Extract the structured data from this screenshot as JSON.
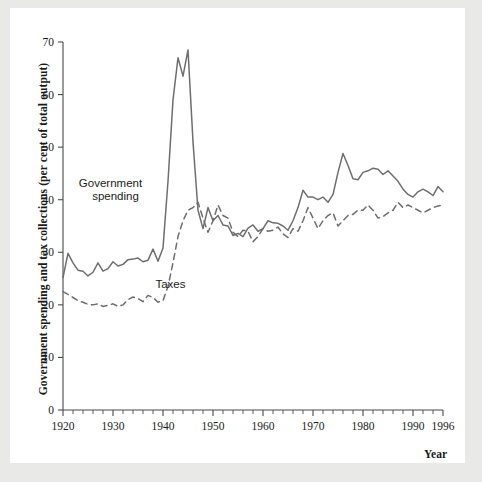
{
  "chart_data": {
    "type": "line",
    "title": "",
    "xlabel": "Year",
    "ylabel": "Government spending and tax collections (per cent of total output)",
    "xlim": [
      1920,
      1996
    ],
    "ylim": [
      0,
      70
    ],
    "grid": false,
    "legend_position": "inline-annotations",
    "y_ticks": [
      0,
      10,
      20,
      30,
      40,
      50,
      60,
      70
    ],
    "y_tick_labels": [
      "0",
      "10",
      "20",
      "30",
      "40",
      "50",
      "60",
      "70"
    ],
    "x_ticks": [
      1920,
      1930,
      1940,
      1950,
      1960,
      1970,
      1980,
      1990,
      1996
    ],
    "x_tick_labels": [
      "1920",
      "1930",
      "1940",
      "1950",
      "1960",
      "1970",
      "1980",
      "1990",
      "1996"
    ],
    "x_minor_tick_step": 2,
    "line_color": "#6e6e6e",
    "annotations": [
      {
        "text": "Government",
        "x": 1929.5,
        "y": 42.5
      },
      {
        "text": "spending",
        "x": 1930.5,
        "y": 40.0
      },
      {
        "text": "Taxes",
        "x": 1941.5,
        "y": 23.3
      }
    ],
    "x": [
      1920,
      1921,
      1922,
      1923,
      1924,
      1925,
      1926,
      1927,
      1928,
      1929,
      1930,
      1931,
      1932,
      1933,
      1934,
      1935,
      1936,
      1937,
      1938,
      1939,
      1940,
      1941,
      1942,
      1943,
      1944,
      1945,
      1946,
      1947,
      1948,
      1949,
      1950,
      1951,
      1952,
      1953,
      1954,
      1955,
      1956,
      1957,
      1958,
      1959,
      1960,
      1961,
      1962,
      1963,
      1964,
      1965,
      1966,
      1967,
      1968,
      1969,
      1970,
      1971,
      1972,
      1973,
      1974,
      1975,
      1976,
      1977,
      1978,
      1979,
      1980,
      1981,
      1982,
      1983,
      1984,
      1985,
      1986,
      1987,
      1988,
      1989,
      1990,
      1991,
      1992,
      1993,
      1994,
      1995,
      1996
    ],
    "series": [
      {
        "name": "Government spending",
        "style": "solid",
        "values": [
          25.2,
          29.8,
          28.0,
          26.6,
          26.4,
          25.5,
          26.2,
          28.0,
          26.4,
          26.9,
          28.2,
          27.4,
          27.7,
          28.6,
          28.7,
          28.9,
          28.2,
          28.5,
          30.6,
          28.3,
          30.8,
          43.5,
          59.0,
          67.0,
          63.5,
          68.5,
          51.0,
          38.0,
          34.5,
          38.5,
          36.0,
          37.0,
          35.2,
          35.0,
          33.2,
          33.6,
          33.0,
          34.6,
          35.2,
          34.0,
          34.5,
          36.0,
          35.6,
          35.5,
          35.0,
          34.2,
          36.0,
          38.5,
          41.8,
          40.5,
          40.5,
          40.0,
          40.5,
          39.5,
          41.0,
          45.2,
          48.8,
          46.5,
          44.0,
          43.8,
          45.2,
          45.5,
          46.0,
          45.8,
          44.8,
          45.5,
          44.5,
          43.5,
          42.0,
          41.0,
          40.5,
          41.5,
          42.0,
          41.5,
          40.8,
          42.5,
          41.5
        ]
      },
      {
        "name": "Taxes",
        "style": "dashed",
        "values": [
          22.5,
          22.0,
          21.4,
          20.8,
          20.5,
          20.1,
          20.0,
          20.2,
          19.7,
          19.9,
          20.2,
          19.7,
          20.0,
          21.0,
          21.5,
          21.2,
          20.6,
          21.8,
          21.4,
          20.5,
          20.8,
          23.5,
          28.0,
          33.0,
          36.0,
          38.0,
          38.5,
          39.5,
          36.5,
          33.8,
          36.0,
          39.0,
          37.0,
          36.5,
          33.8,
          33.0,
          34.2,
          34.0,
          32.0,
          33.0,
          34.5,
          34.0,
          34.2,
          34.8,
          33.5,
          32.8,
          34.5,
          34.0,
          36.0,
          38.5,
          36.5,
          34.5,
          36.0,
          37.0,
          37.5,
          35.0,
          36.0,
          37.0,
          37.2,
          38.0,
          38.0,
          39.0,
          38.0,
          36.5,
          36.8,
          37.5,
          38.0,
          39.5,
          38.5,
          39.0,
          38.5,
          38.0,
          37.5,
          38.0,
          38.5,
          38.8,
          39.0
        ]
      }
    ]
  }
}
